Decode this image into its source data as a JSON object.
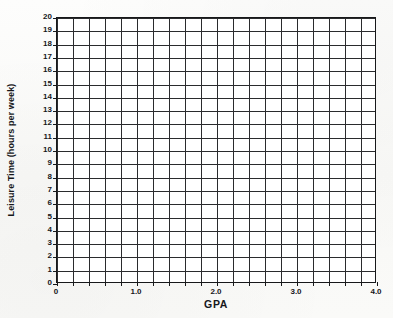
{
  "figure": {
    "title": "",
    "background_color": "#fbfbfa",
    "line_color": "#2a2b2d",
    "frame_color": "#17181a",
    "plot_background": "#ffffff"
  },
  "chart_data": {
    "type": "scatter",
    "title": "",
    "subtitle": "",
    "xlabel": "GPA",
    "ylabel": "Leisure Time (hours per week)",
    "xlim": [
      0,
      4.0
    ],
    "ylim": [
      0,
      20
    ],
    "x_tick_labels": [
      "0",
      "1.0",
      "2.0",
      "3.0",
      "4.0"
    ],
    "x_tick_values": [
      0,
      1.0,
      2.0,
      3.0,
      4.0
    ],
    "y_tick_labels": [
      "0",
      "1",
      "2",
      "3",
      "4",
      "5",
      "6",
      "7",
      "8",
      "9",
      "10",
      "11",
      "12",
      "13",
      "14",
      "15",
      "16",
      "17",
      "18",
      "19",
      "20"
    ],
    "y_tick_values": [
      0,
      1,
      2,
      3,
      4,
      5,
      6,
      7,
      8,
      9,
      10,
      11,
      12,
      13,
      14,
      15,
      16,
      17,
      18,
      19,
      20
    ],
    "grid": true,
    "grid_columns": 20,
    "grid_rows": 20,
    "grid_x_step": 0.2,
    "grid_y_step": 1,
    "legend": null,
    "legend_position": "none",
    "annotations": [],
    "series": [
      {
        "name": "",
        "x": [],
        "y": []
      }
    ],
    "note": "Empty plotting grid — no data points are drawn; axes and gridlines only."
  }
}
